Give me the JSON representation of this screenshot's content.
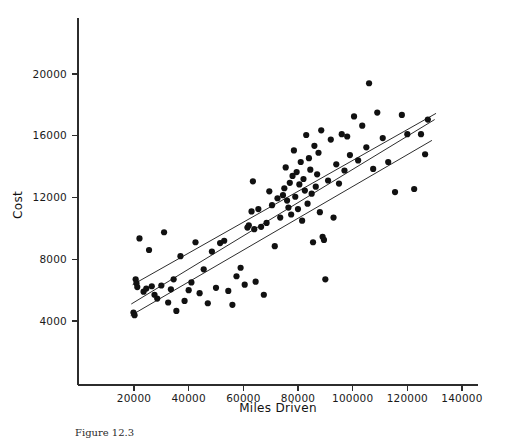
{
  "figure": {
    "caption": "Figure 12.3",
    "background_color": "#ffffff",
    "ink_color": "#111111"
  },
  "chart_data": {
    "type": "scatter",
    "title": "",
    "xlabel": "Miles Driven",
    "ylabel": "Cost",
    "xlim": [
      10000,
      148000
    ],
    "ylim": [
      2200,
      22600
    ],
    "grid": false,
    "legend": "none",
    "xticks": [
      20000,
      40000,
      60000,
      80000,
      100000,
      120000,
      140000
    ],
    "xtick_labels": [
      "20000",
      "40000",
      "60000",
      "80000",
      "100000",
      "120000",
      "140000"
    ],
    "yticks": [
      4000,
      8000,
      12000,
      16000,
      20000
    ],
    "ytick_labels": [
      "4000",
      "8000",
      "12000",
      "16000",
      "20000"
    ],
    "series": [
      {
        "name": "observations",
        "marker": "filled-circle",
        "marker_size": 6.2,
        "color": "#111111",
        "points": [
          [
            19800,
            4550
          ],
          [
            20200,
            4380
          ],
          [
            20600,
            6700
          ],
          [
            20900,
            6450
          ],
          [
            21200,
            6200
          ],
          [
            22000,
            9350
          ],
          [
            23500,
            5900
          ],
          [
            24500,
            6100
          ],
          [
            25500,
            8600
          ],
          [
            26500,
            6250
          ],
          [
            27500,
            5700
          ],
          [
            28500,
            5450
          ],
          [
            30000,
            6300
          ],
          [
            31000,
            9750
          ],
          [
            32500,
            5200
          ],
          [
            33500,
            6050
          ],
          [
            34500,
            6700
          ],
          [
            35500,
            4650
          ],
          [
            37000,
            8200
          ],
          [
            38500,
            5300
          ],
          [
            40000,
            6000
          ],
          [
            41000,
            6500
          ],
          [
            42500,
            9100
          ],
          [
            44000,
            5800
          ],
          [
            45500,
            7350
          ],
          [
            47000,
            5150
          ],
          [
            48500,
            8500
          ],
          [
            50000,
            6150
          ],
          [
            51500,
            9050
          ],
          [
            53000,
            9200
          ],
          [
            54500,
            5950
          ],
          [
            56000,
            5050
          ],
          [
            57500,
            6900
          ],
          [
            59000,
            7450
          ],
          [
            60500,
            6350
          ],
          [
            61500,
            10050
          ],
          [
            62000,
            10200
          ],
          [
            63000,
            11100
          ],
          [
            63500,
            13050
          ],
          [
            64000,
            9950
          ],
          [
            64500,
            6550
          ],
          [
            65500,
            11250
          ],
          [
            66500,
            10100
          ],
          [
            67500,
            5700
          ],
          [
            68500,
            10350
          ],
          [
            69500,
            12400
          ],
          [
            70500,
            11500
          ],
          [
            71500,
            8850
          ],
          [
            72500,
            11950
          ],
          [
            73500,
            10700
          ],
          [
            74500,
            12150
          ],
          [
            75000,
            12600
          ],
          [
            75500,
            13950
          ],
          [
            76000,
            11800
          ],
          [
            76500,
            11350
          ],
          [
            77000,
            12950
          ],
          [
            77500,
            10900
          ],
          [
            78000,
            13400
          ],
          [
            78500,
            15050
          ],
          [
            79000,
            12050
          ],
          [
            79500,
            13650
          ],
          [
            80000,
            11250
          ],
          [
            80500,
            12850
          ],
          [
            81000,
            14300
          ],
          [
            81500,
            10500
          ],
          [
            82000,
            13200
          ],
          [
            82500,
            12450
          ],
          [
            83000,
            16050
          ],
          [
            83500,
            11600
          ],
          [
            84000,
            14550
          ],
          [
            84500,
            13800
          ],
          [
            85000,
            12250
          ],
          [
            85500,
            9100
          ],
          [
            86000,
            15350
          ],
          [
            86500,
            12700
          ],
          [
            87000,
            13500
          ],
          [
            87500,
            14900
          ],
          [
            88000,
            11050
          ],
          [
            88500,
            16350
          ],
          [
            89000,
            9450
          ],
          [
            89500,
            9250
          ],
          [
            90000,
            6700
          ],
          [
            91000,
            13100
          ],
          [
            92000,
            15750
          ],
          [
            93000,
            10700
          ],
          [
            94000,
            14150
          ],
          [
            95000,
            12900
          ],
          [
            96000,
            16100
          ],
          [
            97000,
            13750
          ],
          [
            98000,
            15950
          ],
          [
            99000,
            14750
          ],
          [
            100500,
            17250
          ],
          [
            102000,
            14400
          ],
          [
            103500,
            16650
          ],
          [
            105000,
            15250
          ],
          [
            106000,
            19400
          ],
          [
            107500,
            13850
          ],
          [
            109000,
            17500
          ],
          [
            111000,
            15850
          ],
          [
            113000,
            14300
          ],
          [
            115500,
            12350
          ],
          [
            118000,
            17350
          ],
          [
            120000,
            16100
          ],
          [
            122500,
            12550
          ],
          [
            125000,
            16100
          ],
          [
            126500,
            14800
          ],
          [
            127500,
            17050
          ]
        ]
      }
    ],
    "fit_lines": [
      {
        "name": "fit-line-upper",
        "x_start": 19500,
        "y_start": 6350,
        "x_end": 130500,
        "y_end": 17450
      },
      {
        "name": "fit-line-middle",
        "x_start": 19000,
        "y_start": 5100,
        "x_end": 130000,
        "y_end": 17050
      },
      {
        "name": "fit-line-lower",
        "x_start": 18800,
        "y_start": 4350,
        "x_end": 129000,
        "y_end": 15700
      }
    ]
  }
}
